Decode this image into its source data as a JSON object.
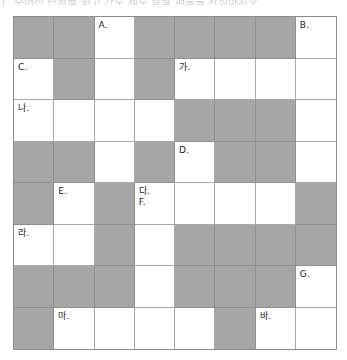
{
  "header": {
    "text": "1. 주어진 단서를 읽고 가로 세로 낱말 퍼즐을 완성하시오."
  },
  "puzzle": {
    "rows": 8,
    "cols": 8,
    "colors": {
      "shaded": "#a6a6a6",
      "white": "#ffffff",
      "grid_line": "#a8a8a8",
      "border": "#8c8c8c"
    },
    "cells": [
      [
        {
          "s": 1
        },
        {
          "s": 1
        },
        {
          "s": 0,
          "label": "A."
        },
        {
          "s": 1
        },
        {
          "s": 1
        },
        {
          "s": 1
        },
        {
          "s": 1
        },
        {
          "s": 0,
          "label": "B."
        }
      ],
      [
        {
          "s": 0,
          "label": "C."
        },
        {
          "s": 1
        },
        {
          "s": 0
        },
        {
          "s": 1
        },
        {
          "s": 0,
          "label": "가."
        },
        {
          "s": 0
        },
        {
          "s": 0
        },
        {
          "s": 0
        }
      ],
      [
        {
          "s": 0,
          "label": "나."
        },
        {
          "s": 0
        },
        {
          "s": 0
        },
        {
          "s": 0
        },
        {
          "s": 1
        },
        {
          "s": 1
        },
        {
          "s": 1
        },
        {
          "s": 0
        }
      ],
      [
        {
          "s": 1
        },
        {
          "s": 1
        },
        {
          "s": 0
        },
        {
          "s": 1
        },
        {
          "s": 0,
          "label": "D."
        },
        {
          "s": 1
        },
        {
          "s": 1
        },
        {
          "s": 0
        }
      ],
      [
        {
          "s": 1
        },
        {
          "s": 0,
          "label": "E."
        },
        {
          "s": 1
        },
        {
          "s": 0,
          "label": "다.\nF."
        },
        {
          "s": 0
        },
        {
          "s": 0
        },
        {
          "s": 0
        },
        {
          "s": 1
        }
      ],
      [
        {
          "s": 0,
          "label": "라."
        },
        {
          "s": 0
        },
        {
          "s": 1
        },
        {
          "s": 0
        },
        {
          "s": 1
        },
        {
          "s": 1
        },
        {
          "s": 1
        },
        {
          "s": 1
        }
      ],
      [
        {
          "s": 1
        },
        {
          "s": 1
        },
        {
          "s": 1
        },
        {
          "s": 0
        },
        {
          "s": 1
        },
        {
          "s": 1
        },
        {
          "s": 1
        },
        {
          "s": 0,
          "label": "G."
        }
      ],
      [
        {
          "s": 1
        },
        {
          "s": 0,
          "label": "마."
        },
        {
          "s": 0
        },
        {
          "s": 0
        },
        {
          "s": 0
        },
        {
          "s": 1
        },
        {
          "s": 0,
          "label": "바."
        },
        {
          "s": 0
        }
      ]
    ],
    "labels": {
      "down": [
        "A.",
        "B.",
        "C.",
        "D.",
        "E.",
        "F.",
        "G."
      ],
      "across": [
        "가.",
        "나.",
        "다.",
        "라.",
        "마.",
        "바."
      ]
    }
  }
}
